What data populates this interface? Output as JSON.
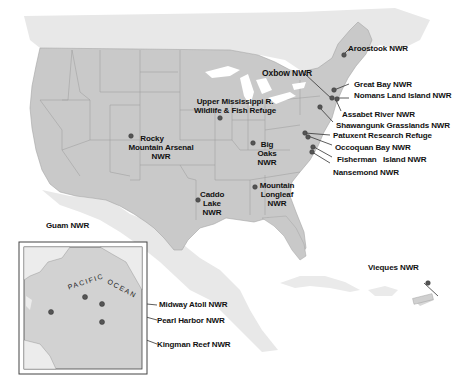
{
  "map": {
    "title": "National Wildlife Refuges",
    "colors": {
      "us_land": "#c9c9c9",
      "neighbor_land": "#e6e6e6",
      "water": "#ffffff",
      "state_border": "#9a9a9a",
      "marker": "#5a5a5a",
      "leader_line": "#333333",
      "label_text": "#111111",
      "inset_border": "#444444"
    },
    "refuges": [
      {
        "id": "aroostook",
        "name": "Aroostook NWR"
      },
      {
        "id": "oxbow",
        "name": "Oxbow NWR"
      },
      {
        "id": "great-bay",
        "name": "Great Bay NWR"
      },
      {
        "id": "nomans-land",
        "name": "Nomans Land Island NWR"
      },
      {
        "id": "assabet",
        "name": "Assabet River NWR"
      },
      {
        "id": "shawangunk",
        "name": "Shawangunk Grasslands NWR"
      },
      {
        "id": "patuxent",
        "name": "Patuxent Research Refuge"
      },
      {
        "id": "occoquan",
        "name": "Occoquan Bay NWR"
      },
      {
        "id": "fisherman",
        "name": "Fisherman   Island NWR"
      },
      {
        "id": "nansemond",
        "name": "Nansemond NWR"
      },
      {
        "id": "upper-miss-1",
        "name": "Upper Mississippi R."
      },
      {
        "id": "upper-miss-2",
        "name": "Wildlife & Fish Refuge"
      },
      {
        "id": "rocky-1",
        "name": "Rocky"
      },
      {
        "id": "rocky-2",
        "name": "Mountain Arsenal"
      },
      {
        "id": "rocky-3",
        "name": "NWR"
      },
      {
        "id": "big-oaks-1",
        "name": "Big"
      },
      {
        "id": "big-oaks-2",
        "name": "Oaks"
      },
      {
        "id": "big-oaks-3",
        "name": "NWR"
      },
      {
        "id": "caddo-1",
        "name": "Caddo"
      },
      {
        "id": "caddo-2",
        "name": "Lake"
      },
      {
        "id": "caddo-3",
        "name": "NWR"
      },
      {
        "id": "longleaf-1",
        "name": "Mountain"
      },
      {
        "id": "longleaf-2",
        "name": "Longleaf"
      },
      {
        "id": "longleaf-3",
        "name": "NWR"
      },
      {
        "id": "vieques",
        "name": "Vieques NWR"
      },
      {
        "id": "guam",
        "name": "Guam NWR"
      },
      {
        "id": "midway",
        "name": "Midway Atoll NWR"
      },
      {
        "id": "pearl-harbor",
        "name": "Pearl Harbor NWR"
      },
      {
        "id": "kingman",
        "name": "Kingman Reef NWR"
      }
    ],
    "inset": {
      "ocean_label_1": "PACIFIC",
      "ocean_label_2": "OCEAN"
    }
  }
}
